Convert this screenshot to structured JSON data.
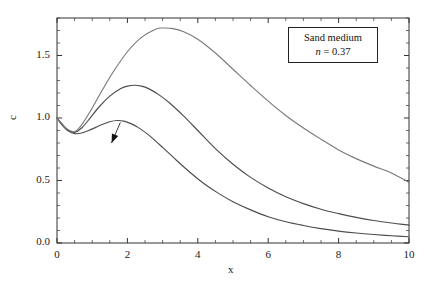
{
  "chart_data": {
    "type": "line",
    "title": "",
    "xlabel": "x",
    "ylabel": "c",
    "xlim": [
      0,
      10
    ],
    "ylim": [
      0,
      1.8
    ],
    "xticks": [
      0,
      2,
      4,
      6,
      8,
      10
    ],
    "xtick_labels": [
      "0",
      "2",
      "4",
      "6",
      "8",
      "10"
    ],
    "yticks": [
      0.0,
      0.5,
      1.0,
      1.5
    ],
    "ytick_labels": [
      "0.0",
      "0.5",
      "1.0",
      "1.5"
    ],
    "minor_ticks": true,
    "grid": false,
    "legend_position": "none",
    "annotation_box": {
      "line1": "Sand medium",
      "line2_symbol": "n",
      "line2_rest": " = 0.37"
    },
    "series": [
      {
        "name": "t = 5",
        "label": "t = 5",
        "color": "#4d4d4d",
        "x": [
          0.0,
          0.15,
          0.3,
          0.5,
          0.7,
          0.9,
          1.1,
          1.3,
          1.5,
          1.7,
          1.9,
          2.1,
          2.3,
          2.6,
          3.0,
          3.4,
          3.8,
          4.2,
          4.6,
          5.0,
          5.5,
          6.0,
          6.5,
          7.0,
          7.5,
          8.0,
          8.5,
          9.0,
          9.5,
          10.0
        ],
        "y": [
          1.0,
          0.94,
          0.9,
          0.875,
          0.88,
          0.9,
          0.925,
          0.95,
          0.97,
          0.98,
          0.975,
          0.955,
          0.925,
          0.865,
          0.765,
          0.66,
          0.56,
          0.47,
          0.395,
          0.33,
          0.265,
          0.21,
          0.17,
          0.14,
          0.115,
          0.095,
          0.08,
          0.068,
          0.058,
          0.05
        ]
      },
      {
        "name": "t = 6",
        "label": "t = 6",
        "color": "#4d4d4d",
        "x": [
          0.0,
          0.15,
          0.3,
          0.5,
          0.7,
          0.9,
          1.2,
          1.5,
          1.8,
          2.0,
          2.2,
          2.4,
          2.6,
          2.9,
          3.2,
          3.6,
          4.0,
          4.5,
          5.0,
          5.5,
          6.0,
          6.5,
          7.0,
          7.5,
          8.0,
          8.5,
          9.0,
          9.5,
          10.0
        ],
        "y": [
          1.0,
          0.95,
          0.905,
          0.885,
          0.92,
          0.985,
          1.09,
          1.175,
          1.235,
          1.255,
          1.262,
          1.255,
          1.235,
          1.185,
          1.12,
          1.015,
          0.9,
          0.755,
          0.63,
          0.525,
          0.44,
          0.37,
          0.315,
          0.27,
          0.235,
          0.205,
          0.18,
          0.16,
          0.143
        ]
      },
      {
        "name": "t = 7",
        "label": "t = 7",
        "color": "#7a7a7a",
        "x": [
          0.0,
          0.15,
          0.3,
          0.5,
          0.7,
          1.0,
          1.3,
          1.6,
          2.0,
          2.4,
          2.8,
          3.0,
          3.3,
          3.6,
          4.0,
          4.5,
          5.0,
          5.5,
          6.0,
          6.5,
          7.0,
          7.5,
          8.0,
          8.5,
          9.0,
          9.5,
          10.0
        ],
        "y": [
          1.0,
          0.95,
          0.91,
          0.89,
          0.945,
          1.08,
          1.23,
          1.37,
          1.53,
          1.645,
          1.71,
          1.72,
          1.715,
          1.69,
          1.63,
          1.52,
          1.39,
          1.26,
          1.135,
          1.02,
          0.92,
          0.83,
          0.745,
          0.675,
          0.615,
          0.56,
          0.485
        ]
      }
    ],
    "annotations": [
      {
        "name": "t = 5",
        "label_x": 1.28,
        "label_y": 0.72,
        "arrow_from_x": 1.55,
        "arrow_from_y": 0.8,
        "arrow_to_x": 1.8,
        "arrow_to_y": 0.965
      },
      {
        "name": "t = 6",
        "label_x": 2.18,
        "label_y": 0.45,
        "arrow_from_x": 2.45,
        "arrow_from_y": 0.545,
        "arrow_to_x": 3.45,
        "arrow_to_y": 1.04
      },
      {
        "name": "t = 7",
        "label_x": 3.6,
        "label_y": 0.175,
        "arrow_from_x": 3.95,
        "arrow_from_y": 0.27,
        "arrow_to_x": 6.6,
        "arrow_to_y": 1.045
      }
    ]
  }
}
